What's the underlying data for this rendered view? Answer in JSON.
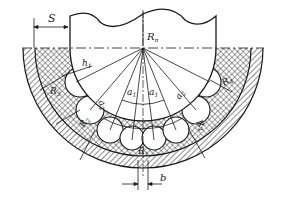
{
  "figure": {
    "labels": {
      "S": "S",
      "R_n": "R",
      "R_n_sub": "n",
      "h1": "h",
      "h1_sub": "1",
      "a1_left": "a",
      "a1_left_sub": "1",
      "a1_right": "a",
      "a1_right_sub": "1",
      "a2_left": "a",
      "a2_left_sub": "2",
      "a2_right": "a",
      "a2_right_sub": "2",
      "R3": "R",
      "R3_sub": "3",
      "R2_left": "R",
      "R2_left_sub": "2",
      "R1": "R",
      "R1_sub": "1",
      "R2_right": "R",
      "R2_right_sub": "2",
      "R4": "R",
      "R4_sub": "4",
      "b": "b"
    },
    "colors": {
      "line": "#1a1a1a",
      "background": "#ffffff"
    }
  }
}
